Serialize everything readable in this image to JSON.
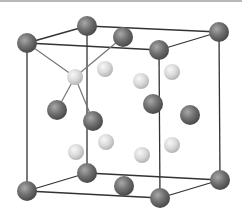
{
  "diagram": {
    "type": "crystal-unit-cell",
    "colors": {
      "background": "#ffffff",
      "edge": "#333333",
      "dark_sphere": "#6f6f6f",
      "dark_sphere_highlight": "#a8a8a8",
      "light_sphere": "#d8d8d8",
      "light_sphere_highlight": "#f6f6f6",
      "bond": "#777777",
      "top_rule": "#b8b8b8"
    },
    "edges": [
      [
        27,
        43,
        159,
        50
      ],
      [
        159,
        50,
        160,
        198
      ],
      [
        160,
        198,
        27,
        191
      ],
      [
        27,
        191,
        27,
        43
      ],
      [
        87,
        26,
        219,
        32
      ],
      [
        219,
        32,
        220,
        180
      ],
      [
        220,
        180,
        87,
        173
      ],
      [
        87,
        173,
        87,
        26
      ],
      [
        27,
        43,
        87,
        26
      ],
      [
        159,
        50,
        219,
        32
      ],
      [
        160,
        198,
        220,
        180
      ],
      [
        27,
        191,
        87,
        173
      ]
    ],
    "bonds": [
      [
        27,
        43,
        75,
        77
      ],
      [
        123,
        37,
        75,
        77
      ],
      [
        57,
        110,
        75,
        77
      ],
      [
        93,
        121,
        75,
        77
      ]
    ],
    "dark_spheres": [
      {
        "x": 87,
        "y": 26,
        "r": 10
      },
      {
        "x": 219,
        "y": 32,
        "r": 10
      },
      {
        "x": 123,
        "y": 37,
        "r": 10
      },
      {
        "x": 27,
        "y": 43,
        "r": 10
      },
      {
        "x": 159,
        "y": 50,
        "r": 10
      },
      {
        "x": 87,
        "y": 173,
        "r": 10
      },
      {
        "x": 220,
        "y": 180,
        "r": 10
      },
      {
        "x": 124,
        "y": 186,
        "r": 10
      },
      {
        "x": 153,
        "y": 104,
        "r": 10
      },
      {
        "x": 190,
        "y": 115,
        "r": 10
      },
      {
        "x": 57,
        "y": 110,
        "r": 10
      },
      {
        "x": 93,
        "y": 121,
        "r": 10
      },
      {
        "x": 27,
        "y": 191,
        "r": 10
      },
      {
        "x": 160,
        "y": 198,
        "r": 10
      }
    ],
    "light_spheres": [
      {
        "x": 105,
        "y": 69,
        "r": 8
      },
      {
        "x": 172,
        "y": 72,
        "r": 8
      },
      {
        "x": 75,
        "y": 77,
        "r": 8
      },
      {
        "x": 141,
        "y": 81,
        "r": 8
      },
      {
        "x": 106,
        "y": 142,
        "r": 8
      },
      {
        "x": 172,
        "y": 145,
        "r": 8
      },
      {
        "x": 76,
        "y": 152,
        "r": 8
      },
      {
        "x": 142,
        "y": 155,
        "r": 8
      }
    ]
  }
}
